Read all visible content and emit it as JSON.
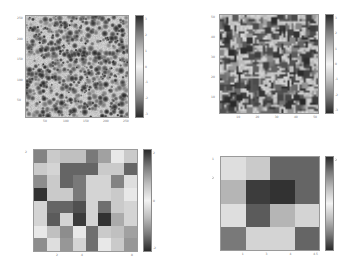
{
  "figure": {
    "width": 356,
    "height": 264,
    "background": "#ffffff",
    "colormap": {
      "name": "diverging-gray",
      "stops": [
        "#2a2a2a",
        "#7a7a7a",
        "#bdbdbd",
        "#f2f2f2",
        "#bdbdbd",
        "#7a7a7a",
        "#2a2a2a"
      ]
    }
  },
  "chart_data": [
    {
      "type": "heatmap",
      "id": "top-left",
      "title": "",
      "resolution": [
        256,
        256
      ],
      "pattern": "noise",
      "seed": 11,
      "blob_size": 6,
      "density": 0.22,
      "x_ticks": [
        "50",
        "100",
        "150",
        "200",
        "250"
      ],
      "y_ticks": [
        "250",
        "200",
        "150",
        "100",
        "50"
      ],
      "colorbar_ticks": [
        "3",
        "2",
        "1",
        "0",
        "-1",
        "-2",
        "-3"
      ],
      "box": {
        "plot": [
          25,
          15,
          104,
          103
        ],
        "cbar": [
          135,
          15,
          9,
          103
        ]
      }
    },
    {
      "type": "heatmap",
      "id": "top-right",
      "title": "",
      "resolution": [
        48,
        48
      ],
      "pattern": "noise",
      "seed": 29,
      "blob_size": 1,
      "density": 0.28,
      "x_ticks": [
        "10",
        "20",
        "30",
        "40",
        "50"
      ],
      "y_ticks": [
        "50",
        "40",
        "30",
        "20",
        "10"
      ],
      "colorbar_ticks": [
        "3",
        "2",
        "1",
        "0",
        "-1",
        "-2",
        "-3"
      ],
      "box": {
        "plot": [
          219,
          14,
          100,
          100
        ],
        "cbar": [
          325,
          14,
          9,
          100
        ]
      }
    },
    {
      "type": "heatmap",
      "id": "bottom-left",
      "title": "",
      "resolution": [
        8,
        8
      ],
      "pattern": "grid",
      "values": [
        [
          0.55,
          0.2,
          0.25,
          0.25,
          0.6,
          0.4,
          0.05,
          0.2
        ],
        [
          0.2,
          0.15,
          0.7,
          0.7,
          0.7,
          0.2,
          0.2,
          0.7
        ],
        [
          0.5,
          0.2,
          0.7,
          0.6,
          0.15,
          0.15,
          0.55,
          0.1
        ],
        [
          0.95,
          0.2,
          0.2,
          0.6,
          0.15,
          0.15,
          0.2,
          0.05
        ],
        [
          0.15,
          0.7,
          0.7,
          0.8,
          0.15,
          0.65,
          0.2,
          0.15
        ],
        [
          0.15,
          0.75,
          0.15,
          0.9,
          0.15,
          0.95,
          0.35,
          0.15
        ],
        [
          0.05,
          0.25,
          0.5,
          0.05,
          0.65,
          0.2,
          0.25,
          0.4
        ],
        [
          0.5,
          0.1,
          0.45,
          0.15,
          0.65,
          0.05,
          0.2,
          0.45
        ]
      ],
      "x_ticks": [
        "2",
        "4",
        "",
        "8"
      ],
      "y_ticks": [
        "2"
      ],
      "colorbar_ticks": [
        "2",
        "0",
        "-2"
      ],
      "box": {
        "plot": [
          33,
          149,
          105,
          103
        ],
        "cbar": [
          143,
          149,
          9,
          103
        ]
      }
    },
    {
      "type": "heatmap",
      "id": "bottom-right",
      "title": "",
      "resolution": [
        4,
        4
      ],
      "pattern": "grid",
      "values": [
        [
          0.1,
          0.2,
          0.7,
          0.7
        ],
        [
          0.3,
          0.9,
          0.95,
          0.7
        ],
        [
          0.1,
          0.75,
          0.3,
          0.15
        ],
        [
          0.6,
          0.15,
          0.15,
          0.7
        ]
      ],
      "x_ticks": [
        "1",
        "3",
        "4",
        "4.5"
      ],
      "y_ticks": [
        "1",
        "2"
      ],
      "colorbar_ticks": [
        "2"
      ],
      "box": {
        "plot": [
          220,
          156,
          100,
          95
        ],
        "cbar": [
          325,
          156,
          9,
          95
        ]
      }
    }
  ]
}
